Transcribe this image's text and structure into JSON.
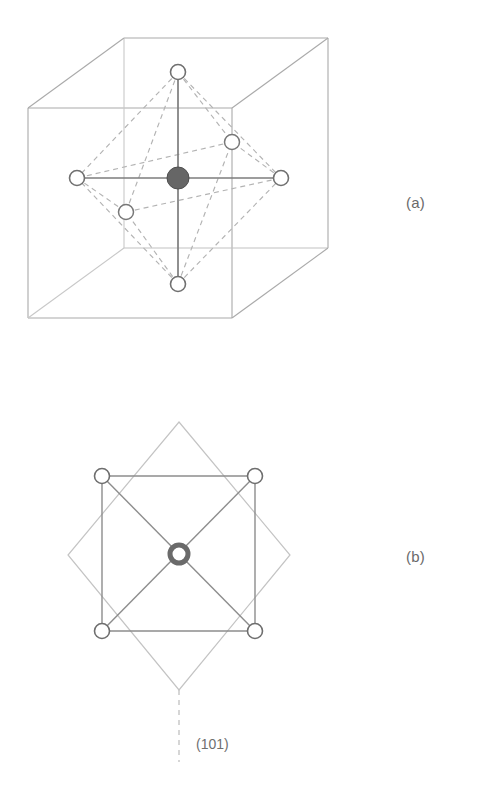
{
  "figure": {
    "background_color": "#ffffff",
    "line_color": "#8a8a8a",
    "cube_edge_color": "#a9a9a9",
    "dashed_color": "#b0b0b0",
    "solid_bond_color": "#7a7a7a",
    "center_atom_fill": "#666666",
    "center_atom_stroke": "#4a4a4a",
    "ligand_fill": "#ffffff",
    "ligand_stroke": "#6e6e6e",
    "ring_atom_stroke": "#6a6a6a"
  },
  "panels": [
    {
      "id": "a",
      "label": "(a)",
      "label_position": {
        "x": 406,
        "y": 194
      },
      "description": "Perspective cube with inscribed octahedron",
      "cube": {
        "front_face": {
          "x": 28,
          "y": 108,
          "width": 204,
          "height": 210
        },
        "depth_offset": {
          "dx": 96,
          "dy": -70
        },
        "corners": {
          "front_top_left": {
            "x": 28,
            "y": 108
          },
          "front_top_right": {
            "x": 232,
            "y": 108
          },
          "front_bottom_left": {
            "x": 28,
            "y": 318
          },
          "front_bottom_right": {
            "x": 232,
            "y": 318
          },
          "back_top_left": {
            "x": 124,
            "y": 38
          },
          "back_top_right": {
            "x": 328,
            "y": 38
          },
          "back_bottom_right": {
            "x": 328,
            "y": 248
          },
          "back_bottom_left": {
            "x": 124,
            "y": 248
          }
        }
      },
      "center_atom": {
        "x": 178,
        "y": 178,
        "radius": 11,
        "kind": "filled"
      },
      "ligands": [
        {
          "name": "top",
          "x": 178,
          "y": 72,
          "radius": 7.5
        },
        {
          "name": "bottom",
          "x": 178,
          "y": 284,
          "radius": 7.5
        },
        {
          "name": "left",
          "x": 77,
          "y": 178,
          "radius": 7.5
        },
        {
          "name": "right",
          "x": 281,
          "y": 178,
          "radius": 7.5
        },
        {
          "name": "front",
          "x": 126,
          "y": 212,
          "radius": 7.5
        },
        {
          "name": "back",
          "x": 232,
          "y": 142,
          "radius": 7.5
        }
      ],
      "solid_bonds": [
        [
          "top",
          "bottom"
        ],
        [
          "left",
          "right"
        ]
      ],
      "dashed_bonds": [
        [
          "top",
          "left"
        ],
        [
          "top",
          "right"
        ],
        [
          "top",
          "front"
        ],
        [
          "top",
          "back"
        ],
        [
          "bottom",
          "left"
        ],
        [
          "bottom",
          "right"
        ],
        [
          "bottom",
          "front"
        ],
        [
          "bottom",
          "back"
        ],
        [
          "left",
          "front"
        ],
        [
          "front",
          "right"
        ],
        [
          "right",
          "back"
        ],
        [
          "back",
          "left"
        ]
      ]
    },
    {
      "id": "b",
      "label": "(b)",
      "label_position": {
        "x": 406,
        "y": 548
      },
      "description": "Plan view: diamond outline with inscribed square, diagonals and central ring atom",
      "diamond": {
        "top": {
          "x": 179,
          "y": 422
        },
        "right": {
          "x": 290,
          "y": 555
        },
        "bottom": {
          "x": 179,
          "y": 690
        },
        "left": {
          "x": 68,
          "y": 555
        }
      },
      "inner_square": {
        "top_left": {
          "x": 102,
          "y": 476
        },
        "top_right": {
          "x": 255,
          "y": 476
        },
        "bottom_right": {
          "x": 255,
          "y": 631
        },
        "bottom_left": {
          "x": 102,
          "y": 631
        }
      },
      "corner_atoms": [
        {
          "name": "top-left",
          "x": 102,
          "y": 476,
          "radius": 7.5
        },
        {
          "name": "top-right",
          "x": 255,
          "y": 476,
          "radius": 7.5
        },
        {
          "name": "bottom-right",
          "x": 255,
          "y": 631,
          "radius": 7.5
        },
        {
          "name": "bottom-left",
          "x": 102,
          "y": 631,
          "radius": 7.5
        }
      ],
      "center_atom": {
        "x": 179,
        "y": 554,
        "radius": 10,
        "kind": "ring",
        "ring_width": 5
      },
      "plane_indicator": {
        "line_from": {
          "x": 179,
          "y": 690
        },
        "line_to": {
          "x": 179,
          "y": 762
        },
        "style": "dashed"
      },
      "plane_label": "(101)",
      "plane_label_position": {
        "x": 196,
        "y": 736
      }
    }
  ]
}
